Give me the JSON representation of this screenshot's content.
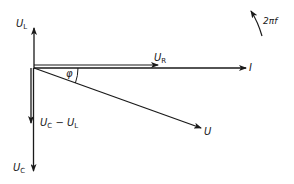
{
  "diagram": {
    "type": "phasor-diagram",
    "colors": {
      "background": "#ffffff",
      "stroke": "#1a1a1a"
    },
    "origin": [
      34,
      68
    ],
    "vectors": [
      {
        "id": "U_L",
        "label_main": "U",
        "label_sub": "L",
        "direction": "up",
        "from": [
          34,
          68
        ],
        "to": [
          34,
          27
        ]
      },
      {
        "id": "U_R",
        "label_main": "U",
        "label_sub": "R",
        "direction": "right",
        "from": [
          34,
          65
        ],
        "to": [
          158,
          65
        ]
      },
      {
        "id": "I",
        "label_main": "I",
        "label_sub": "",
        "direction": "right",
        "from": [
          34,
          68
        ],
        "to": [
          246,
          68
        ]
      },
      {
        "id": "U",
        "label_main": "U",
        "label_sub": "",
        "direction": "down-right",
        "from": [
          34,
          68
        ],
        "to": [
          201,
          128
        ]
      },
      {
        "id": "U_C_minus_U_L",
        "label_main": "U",
        "label_sub": "C",
        "label_mid": " − U",
        "label_sub2": "L",
        "direction": "down",
        "from": [
          31,
          68
        ],
        "to": [
          31,
          123
        ]
      },
      {
        "id": "U_C",
        "label_main": "U",
        "label_sub": "C",
        "direction": "down",
        "from": [
          33,
          68
        ],
        "to": [
          33,
          171
        ]
      }
    ],
    "angle": {
      "symbol": "φ",
      "between": [
        "I",
        "U"
      ]
    },
    "rotation": {
      "label": "2πf",
      "meaning": "angular velocity, counter-clockwise"
    }
  }
}
